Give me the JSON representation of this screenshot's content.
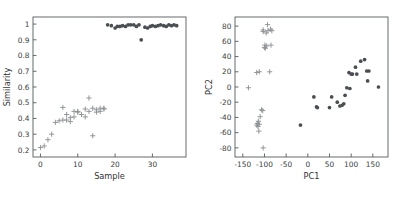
{
  "figure": {
    "background": "#ffffff",
    "marker_circle_color": "#4a4e52",
    "marker_plus_color": "#8e9296",
    "axis_color": "#555a5e"
  },
  "chart_data": [
    {
      "type": "scatter",
      "panel": "left",
      "title": "",
      "xlabel": "Sample",
      "ylabel": "Similarity",
      "xlim": [
        -2,
        39
      ],
      "ylim": [
        0.155,
        1.045
      ],
      "xticks": [
        0,
        10,
        20,
        30
      ],
      "xticklabels": [
        "0",
        "10",
        "20",
        "30"
      ],
      "yticks": [
        0.2,
        0.3,
        0.4,
        0.5,
        0.6,
        0.7,
        0.8,
        0.9,
        1
      ],
      "yticklabels": [
        "0.2",
        "0.3",
        "0.4",
        "0.5",
        "0.6",
        "0.7",
        "0.8",
        "0.9",
        "1"
      ],
      "grid": false,
      "legend": "none",
      "series": [
        {
          "name": "low-similarity-group",
          "marker": "plus",
          "x": [
            0,
            1,
            2,
            3,
            4,
            5,
            6,
            6,
            7,
            7,
            8,
            8,
            9,
            9,
            10,
            10,
            11,
            12,
            12,
            13,
            13,
            14,
            14,
            15,
            15,
            16,
            16,
            17,
            17
          ],
          "y": [
            0.215,
            0.225,
            0.265,
            0.3,
            0.375,
            0.385,
            0.47,
            0.39,
            0.425,
            0.39,
            0.405,
            0.38,
            0.445,
            0.41,
            0.445,
            0.44,
            0.425,
            0.46,
            0.41,
            0.53,
            0.445,
            0.465,
            0.29,
            0.44,
            0.455,
            0.465,
            0.445,
            0.465,
            0.46
          ]
        },
        {
          "name": "high-similarity-group",
          "marker": "circle",
          "x": [
            18,
            19,
            20,
            20.6,
            21.3,
            22,
            22.8,
            23.5,
            24.2,
            25,
            25.7,
            26.4,
            27,
            28,
            28.7,
            29.4,
            30,
            30.8,
            31.5,
            32.2,
            33,
            33.7,
            34.4,
            35.1,
            35.8,
            36.5
          ],
          "y": [
            0.995,
            0.99,
            0.975,
            0.985,
            0.985,
            0.99,
            0.985,
            0.995,
            0.995,
            0.995,
            0.985,
            0.995,
            0.9,
            0.98,
            0.975,
            0.985,
            0.99,
            0.985,
            0.99,
            0.995,
            0.99,
            0.985,
            0.995,
            0.99,
            0.995,
            0.99
          ]
        }
      ]
    },
    {
      "type": "scatter",
      "panel": "right",
      "title": "",
      "xlabel": "PC1",
      "ylabel": "PC2",
      "xlim": [
        -168,
        185
      ],
      "ylim": [
        -92,
        92
      ],
      "xticks": [
        -150,
        -100,
        -50,
        0,
        50,
        100,
        150
      ],
      "xticklabels": [
        "-150",
        "-100",
        "-50",
        "0",
        "50",
        "100",
        "150"
      ],
      "yticks": [
        -80,
        -60,
        -40,
        -20,
        0,
        20,
        40,
        60,
        80
      ],
      "yticklabels": [
        "-80",
        "-60",
        "-40",
        "-20",
        "0",
        "20",
        "40",
        "60",
        "80"
      ],
      "grid": false,
      "legend": "none",
      "series": [
        {
          "name": "group-a",
          "marker": "plus",
          "x": [
            -137,
            -118,
            -112,
            -103,
            -103,
            -100,
            -99,
            -98,
            -96,
            -95,
            -93,
            -92,
            -88,
            -86,
            -85,
            -83,
            -118,
            -116,
            -115,
            -114,
            -113,
            -112,
            -110,
            -107,
            -104,
            -103
          ],
          "y": [
            -1,
            19,
            20,
            75,
            73,
            52,
            55,
            51,
            71,
            54,
            82,
            74,
            20,
            76,
            55,
            74,
            -50,
            -48,
            -52,
            -45,
            -58,
            -49,
            -39,
            -30,
            -31,
            -80
          ]
        },
        {
          "name": "group-b",
          "marker": "circle",
          "x": [
            -17,
            14,
            20,
            22,
            50,
            55,
            68,
            74,
            79,
            83,
            86,
            90,
            95,
            97,
            100,
            103,
            110,
            113,
            122,
            131,
            136,
            138,
            141,
            163
          ],
          "y": [
            -50,
            -13,
            -26,
            -27,
            -27,
            -13,
            -20,
            -25,
            -24,
            -22,
            -11,
            -1,
            19,
            -2,
            17,
            17,
            26,
            17,
            34,
            36,
            21,
            8,
            21,
            0
          ]
        }
      ]
    }
  ]
}
